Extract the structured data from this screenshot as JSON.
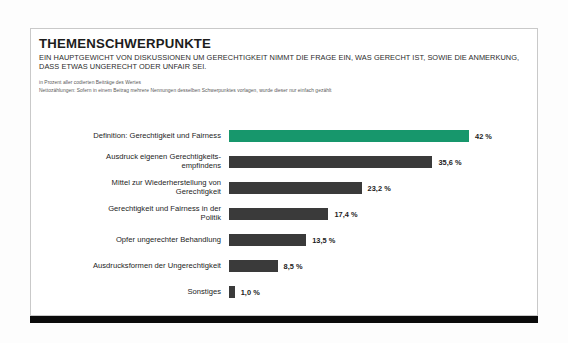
{
  "card": {
    "title": "THEMENSCHWERPUNKTE",
    "subtitle": "EIN HAUPTGEWICHT VON DISKUSSIONEN UM GERECHTIGKEIT NIMMT DIE FRAGE EIN, WAS GERECHT IST, SOWIE DIE ANMERKUNG, DASS ETWAS UNGERECHT ODER UNFAIR SEI.",
    "notes": [
      "in Prozent aller codierten Beiträge des Wertes",
      "Nettozählungen: Sofern in einem Beitrag mehrere Nennungen desselben Schwerpunktes vorlagen, wurde dieser nur einfach gezählt"
    ]
  },
  "colors": {
    "accent": "#17976c",
    "bar": "#3a3a3a",
    "foot_bar": "#0b0b0b",
    "card_border": "#c9c9c9"
  },
  "chart_data": {
    "type": "bar",
    "orientation": "horizontal",
    "title": "THEMENSCHWERPUNKTE",
    "subtitle": "EIN HAUPTGEWICHT VON DISKUSSIONEN UM GERECHTIGKEIT NIMMT DIE FRAGE EIN, WAS GERECHT IST, SOWIE DIE ANMERKUNG, DASS ETWAS UNGERECHT ODER UNFAIR SEI.",
    "xlabel": "",
    "ylabel": "",
    "xlim": [
      0,
      42
    ],
    "grid": false,
    "legend": false,
    "categories": [
      "Definition: Gerechtigkeit und Fairness",
      "Ausdruck eigenen Gerechtigkeits-empfindens",
      "Mittel zur Wiederherstellung von Gerechtigkeit",
      "Gerechtigkeit und Fairness in der Politik",
      "Opfer ungerechter Behandlung",
      "Ausdrucksformen der Ungerechtigkeit",
      "Sonstiges"
    ],
    "values": [
      42,
      35.6,
      23.2,
      17.4,
      13.5,
      8.5,
      1.0
    ],
    "value_labels": [
      "42 %",
      "35,6 %",
      "23,2 %",
      "17,4 %",
      "13,5 %",
      "8,5 %",
      "1,0 %"
    ],
    "highlight_index": 0
  },
  "bars": [
    {
      "label_line1": "Definition: Gerechtigkeit und Fairness",
      "label_line2": "",
      "value": 42,
      "value_label": "42 %",
      "accent": true
    },
    {
      "label_line1": "Ausdruck eigenen Gerechtigkeits-",
      "label_line2": "empfindens",
      "value": 35.6,
      "value_label": "35,6 %",
      "accent": false
    },
    {
      "label_line1": "Mittel zur Wiederherstellung von",
      "label_line2": "Gerechtigkeit",
      "value": 23.2,
      "value_label": "23,2 %",
      "accent": false
    },
    {
      "label_line1": "Gerechtigkeit und Fairness in der",
      "label_line2": "Politik",
      "value": 17.4,
      "value_label": "17,4 %",
      "accent": false
    },
    {
      "label_line1": "Opfer ungerechter Behandlung",
      "label_line2": "",
      "value": 13.5,
      "value_label": "13,5 %",
      "accent": false
    },
    {
      "label_line1": "Ausdrucksformen der Ungerechtigkeit",
      "label_line2": "",
      "value": 8.5,
      "value_label": "8,5 %",
      "accent": false
    },
    {
      "label_line1": "Sonstiges",
      "label_line2": "",
      "value": 1.0,
      "value_label": "1,0 %",
      "accent": false
    }
  ]
}
